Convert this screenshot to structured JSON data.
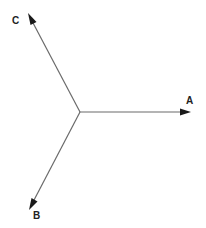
{
  "diagram": {
    "type": "vector-diagram",
    "vectors": [
      {
        "id": "A",
        "label": "A",
        "direction": "right",
        "angle_deg": 0
      },
      {
        "id": "B",
        "label": "B",
        "direction": "down-left",
        "angle_deg": 240
      },
      {
        "id": "C",
        "label": "C",
        "direction": "up-left",
        "angle_deg": 117
      }
    ],
    "colors": {
      "line": "#6a6a6a",
      "arrowhead": "#1a1a1a",
      "label": "#222222",
      "background": "#ffffff"
    }
  }
}
